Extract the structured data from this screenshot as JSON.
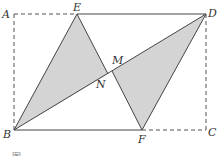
{
  "diagram": {
    "type": "geometry",
    "colors": {
      "stroke": "#444444",
      "dashed": "#555555",
      "fill": "#d4d4d4",
      "label": "#333333"
    },
    "points": {
      "A": {
        "label": "A",
        "x": 14,
        "y": 14
      },
      "E": {
        "label": "E",
        "x": 77,
        "y": 14
      },
      "D": {
        "label": "D",
        "x": 206,
        "y": 14
      },
      "B": {
        "label": "B",
        "x": 14,
        "y": 130
      },
      "F": {
        "label": "F",
        "x": 142,
        "y": 130
      },
      "C": {
        "label": "C",
        "x": 206,
        "y": 130
      },
      "M": {
        "label": "M",
        "x": 112,
        "y": 71
      },
      "N": {
        "label": "N",
        "x": 108,
        "y": 74
      }
    },
    "caption": "图 …"
  }
}
